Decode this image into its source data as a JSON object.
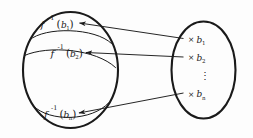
{
  "figure": {
    "type": "math-diagram",
    "background_color": "#fdfdfd",
    "ink_color": "#1a1a1a"
  },
  "domain_set": {
    "name": "left-ellipse",
    "regions": [
      {
        "id": "fiber-1",
        "label_f": "f",
        "label_exponent": "-1",
        "label_open": "(",
        "label_arg": "b",
        "label_arg_sub": "1",
        "label_close": ")",
        "label_full": "f⁻¹(b₁)"
      },
      {
        "id": "fiber-2",
        "label_f": "f",
        "label_exponent": "-1",
        "label_open": "(",
        "label_arg": "b",
        "label_arg_sub": "2",
        "label_close": ")",
        "label_full": "f⁻¹(b₂)"
      },
      {
        "id": "fiber-n",
        "label_f": "f",
        "label_exponent": "-1",
        "label_open": "(",
        "label_arg": "b",
        "label_arg_sub": "n",
        "label_close": ")",
        "label_full": "f⁻¹(bₙ)"
      }
    ]
  },
  "codomain_set": {
    "name": "right-ellipse",
    "points": [
      {
        "id": "point-b1",
        "marker": "×",
        "label": "b",
        "sub": "1"
      },
      {
        "id": "point-b2",
        "marker": "×",
        "label": "b",
        "sub": "2"
      },
      {
        "id": "point-bn",
        "marker": "×",
        "label": "b",
        "sub": "n"
      }
    ],
    "ellipsis": "⋮"
  },
  "arrows": [
    {
      "id": "arrow-b1",
      "from": "point-b1",
      "to": "fiber-1",
      "direction": "right-to-left"
    },
    {
      "id": "arrow-b2",
      "from": "point-b2",
      "to": "fiber-2",
      "direction": "right-to-left"
    },
    {
      "id": "arrow-bn",
      "from": "point-bn",
      "to": "fiber-n",
      "direction": "right-to-left"
    }
  ]
}
